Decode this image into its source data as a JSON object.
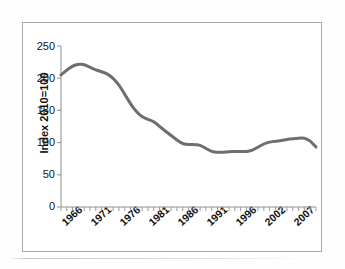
{
  "chart_data": {
    "type": "line",
    "title": "",
    "xlabel": "",
    "ylabel": "Index 2010=100",
    "ylim": [
      0,
      250
    ],
    "ytick_labels": [
      "250",
      "200",
      "150",
      "100",
      "50",
      "0"
    ],
    "ytick_values": [
      250,
      200,
      150,
      100,
      50,
      0
    ],
    "xlim": [
      1965,
      2009
    ],
    "xtick_labels": [
      "1966",
      "1971",
      "1976",
      "1981",
      "1986",
      "1991",
      "1996",
      "2002",
      "2007"
    ],
    "xtick_values": [
      1966,
      1971,
      1976,
      1981,
      1986,
      1991,
      1996,
      2002,
      2007
    ],
    "grid": false,
    "legend": "none",
    "series": [
      {
        "name": "Index 2010=100",
        "color": "#6e6e6e",
        "x": [
          1965,
          1966,
          1967,
          1968,
          1969,
          1970,
          1971,
          1972,
          1973,
          1974,
          1975,
          1976,
          1977,
          1978,
          1979,
          1980,
          1981,
          1982,
          1983,
          1984,
          1985,
          1986,
          1987,
          1988,
          1989,
          1990,
          1991,
          1992,
          1993,
          1994,
          1995,
          1996,
          1997,
          1998,
          1999,
          2000,
          2001,
          2002,
          2003,
          2004,
          2005,
          2006,
          2007,
          2008,
          2009
        ],
        "values": [
          205,
          213,
          219,
          222,
          221,
          217,
          213,
          210,
          207,
          200,
          190,
          175,
          160,
          148,
          140,
          136,
          133,
          125,
          118,
          111,
          104,
          98,
          97,
          97,
          96,
          91,
          86,
          85,
          85,
          86,
          86,
          86,
          86,
          88,
          93,
          98,
          101,
          102,
          103,
          105,
          106,
          107,
          107,
          103,
          93
        ]
      }
    ]
  },
  "axis": {
    "y_title": "Index 2010=100"
  }
}
